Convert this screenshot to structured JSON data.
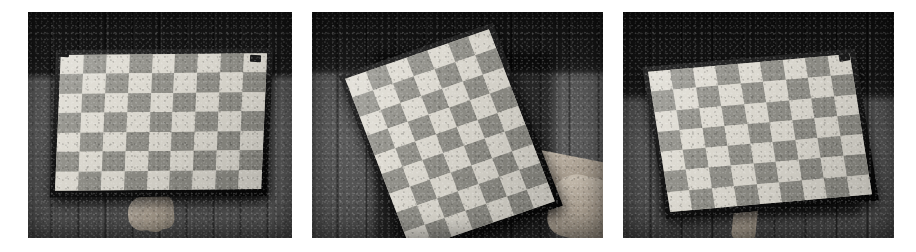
{
  "figure": {
    "kind": "camera-calibration-photo-strip",
    "background_color": "#ffffff",
    "width": 916,
    "height": 252,
    "panel_count": 3,
    "caption": ""
  },
  "panels": [
    {
      "id": "panel-1",
      "name": "checkerboard-frontal-view",
      "description": "Checkerboard calibration target held nearly frontal against a panelled wall, slightly rotated clockwise, with a thumb supporting it from below.",
      "x": 28,
      "y": 12,
      "width": 264,
      "height": 226,
      "board": {
        "columns": 9,
        "rows": 7,
        "rotation_deg": 2.5,
        "skew_deg": -3,
        "light_square_color": "#dcd9d0",
        "dark_square_color": "#8e8d86",
        "backing_color": "#111111"
      },
      "hand": {
        "visible": true,
        "position": "bottom-center",
        "part": "thumb"
      },
      "clips": 2
    },
    {
      "id": "panel-2",
      "name": "checkerboard-rotated-view",
      "description": "Checkerboard calibration target rotated roughly twenty degrees counter-clockwise, gripped by a hand at its lower right edge.",
      "x": 312,
      "y": 12,
      "width": 291,
      "height": 226,
      "board": {
        "columns": 7,
        "rows": 9,
        "rotation_deg": -19,
        "skew_deg": 2,
        "light_square_color": "#dcd9d0",
        "dark_square_color": "#8e8d86",
        "backing_color": "#111111"
      },
      "hand": {
        "visible": true,
        "position": "right",
        "part": "hand"
      },
      "clips": 0
    },
    {
      "id": "panel-3",
      "name": "checkerboard-tilted-view",
      "description": "Checkerboard calibration target tilted so its top right corner is raised, resting on a small support at the bottom.",
      "x": 623,
      "y": 12,
      "width": 271,
      "height": 226,
      "board": {
        "columns": 9,
        "rows": 7,
        "rotation_deg": -9,
        "skew_deg": 4,
        "light_square_color": "#dcd9d0",
        "dark_square_color": "#8e8d86",
        "backing_color": "#111111"
      },
      "hand": {
        "visible": true,
        "position": "bottom-center",
        "part": "support"
      },
      "clips": 1
    }
  ],
  "scene": {
    "wall_description": "vertically panelled wooden wall",
    "top_band_description": "dark horizontal band across the upper portion of each frame",
    "palette": {
      "wall_light": "#5c5c5c",
      "wall_dark": "#141414",
      "board_light": "#dcd9d0",
      "board_dark": "#8e8d86",
      "skin": "#b8ad9e",
      "frame_background": "#ffffff"
    }
  }
}
